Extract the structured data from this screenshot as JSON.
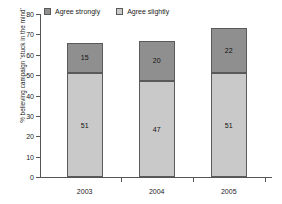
{
  "chart_data": {
    "type": "bar",
    "stacked": true,
    "title": "",
    "subtitle": "",
    "xlabel": "",
    "ylabel": "% believing campaign 'stuck in the mind'",
    "ylim": [
      0,
      80
    ],
    "ytick_step": 10,
    "yticks": [
      0,
      10,
      20,
      30,
      40,
      50,
      60,
      70,
      80
    ],
    "ytick_labels": [
      "0",
      "10",
      "20",
      "30",
      "40",
      "50",
      "60",
      "70",
      "80"
    ],
    "grid": false,
    "legend_position": "top-left",
    "categories": [
      "2003",
      "2004",
      "2005"
    ],
    "series": [
      {
        "name": "Agree slightly",
        "color": "#c9c9c9",
        "values": [
          51,
          47,
          51
        ],
        "labels": [
          "51",
          "47",
          "51"
        ]
      },
      {
        "name": "Agree strongly",
        "color": "#8f8f8f",
        "values": [
          15,
          20,
          22
        ],
        "labels": [
          "15",
          "20",
          "22"
        ]
      }
    ],
    "totals": [
      66,
      67,
      73
    ],
    "stack_order": [
      "Agree slightly",
      "Agree strongly"
    ]
  },
  "legend": {
    "items": [
      {
        "label": "Agree strongly",
        "color": "#8f8f8f"
      },
      {
        "label": "Agree slightly",
        "color": "#c9c9c9"
      }
    ]
  },
  "colors": {
    "agree_strongly": "#8f8f8f",
    "agree_slightly": "#c9c9c9",
    "axis": "#555555",
    "text": "#1a1a1a",
    "background": "#ffffff",
    "bar_border": "#5a5a5a"
  }
}
